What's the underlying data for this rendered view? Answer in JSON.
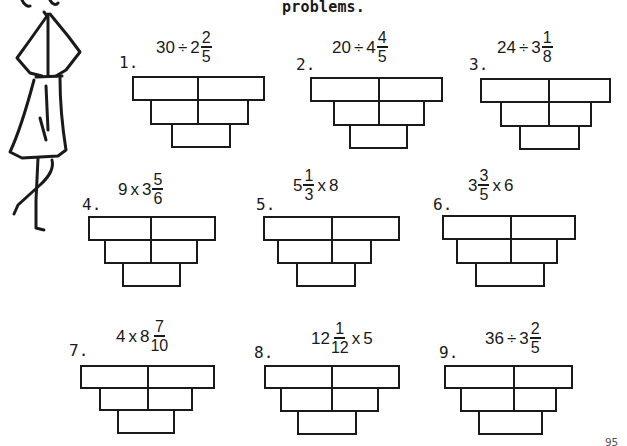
{
  "header": {
    "text": "problems."
  },
  "problems": [
    {
      "label": "1.",
      "whole_before": "30",
      "operator": "÷",
      "whole": "2",
      "numerator": "2",
      "denominator": "5",
      "order": "number-op-mixed"
    },
    {
      "label": "2.",
      "whole_before": "20",
      "operator": "÷",
      "whole": "4",
      "numerator": "4",
      "denominator": "5",
      "order": "number-op-mixed"
    },
    {
      "label": "3.",
      "whole_before": "24",
      "operator": "÷",
      "whole": "3",
      "numerator": "1",
      "denominator": "8",
      "order": "number-op-mixed"
    },
    {
      "label": "4.",
      "whole_before": "9",
      "operator": "x",
      "whole": "3",
      "numerator": "5",
      "denominator": "6",
      "order": "number-op-mixed"
    },
    {
      "label": "5.",
      "whole": "5",
      "numerator": "1",
      "denominator": "3",
      "operator": "x",
      "whole_after": "8",
      "order": "mixed-op-number"
    },
    {
      "label": "6.",
      "whole": "3",
      "numerator": "3",
      "denominator": "5",
      "operator": "x",
      "whole_after": "6",
      "order": "mixed-op-number"
    },
    {
      "label": "7.",
      "whole_before": "4",
      "operator": "x",
      "whole": "8",
      "numerator": "7",
      "denominator": "10",
      "order": "number-op-mixed"
    },
    {
      "label": "8.",
      "whole": "12",
      "numerator": "1",
      "denominator": "12",
      "operator": "x",
      "whole_after": "5",
      "order": "mixed-op-number"
    },
    {
      "label": "9.",
      "whole_before": "36",
      "operator": "÷",
      "whole": "3",
      "numerator": "2",
      "denominator": "5",
      "order": "number-op-mixed"
    }
  ],
  "answer_box_layout": {
    "rows": 3,
    "cells_per_row": [
      2,
      2,
      1
    ]
  },
  "footer": {
    "page_number": "95"
  },
  "illustration": {
    "icon": "woman-stick-figure-icon"
  }
}
